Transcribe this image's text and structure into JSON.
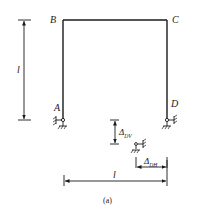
{
  "diagram": {
    "type": "portal-frame-support-settlement",
    "caption": "(a)",
    "nodes": {
      "A": "A",
      "B": "B",
      "C": "C",
      "D": "D"
    },
    "dimensions": {
      "height_label": "l",
      "span_label": "l",
      "vertical_settlement": {
        "symbol": "Δ",
        "subscript": "DV"
      },
      "horizontal_settlement": {
        "symbol": "Δ",
        "subscript": "DH"
      }
    },
    "supports": {
      "A": "fixed-hinge with horizontal restraint",
      "D": "fixed-hinge with horizontal restraint (settles)",
      "D_displaced": "displaced position of support D"
    },
    "colors": {
      "line": "#1a1a1a",
      "background": "#ffffff"
    }
  }
}
